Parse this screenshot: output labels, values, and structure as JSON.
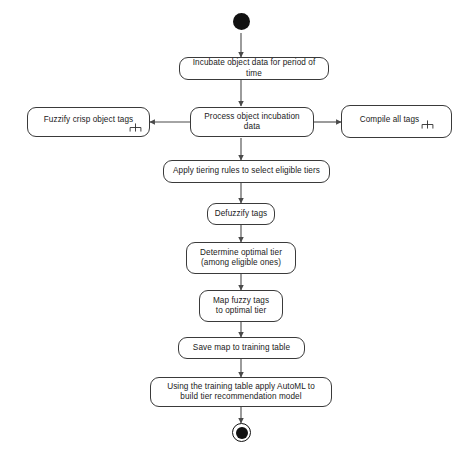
{
  "diagram": {
    "type": "uml-activity-diagram",
    "canvas": {
      "width": 472,
      "height": 457,
      "background": "#ffffff"
    },
    "style": {
      "node_stroke": "#3a3a3a",
      "node_fill": "#ffffff",
      "edge_stroke": "#4a4a4a",
      "terminal_fill": "#111111",
      "text_color": "#1a1a1a"
    },
    "nodes": {
      "start": {
        "name": "initial-node",
        "kind": "initial"
      },
      "incubate": {
        "label": "Incubate object data for period of time",
        "kind": "action"
      },
      "process": {
        "label": "Process object incubation data",
        "kind": "action"
      },
      "fuzzify": {
        "label": "Fuzzify crisp object tags",
        "kind": "call-behavior-action",
        "icon": "rake-icon"
      },
      "compile": {
        "label": "Compile all tags",
        "kind": "call-behavior-action",
        "icon": "rake-icon"
      },
      "apply_tiering": {
        "label": "Apply tiering rules to select eligible tiers",
        "kind": "action"
      },
      "defuzzify": {
        "label": "Defuzzify tags",
        "kind": "action"
      },
      "determine_tier": {
        "label": "Determine optimal tier\n(among eligible ones)",
        "kind": "action"
      },
      "map_tags": {
        "label": "Map fuzzy tags\nto optimal tier",
        "kind": "action"
      },
      "save_map": {
        "label": "Save map to training table",
        "kind": "action"
      },
      "automl": {
        "label": "Using the training table apply AutoML to\nbuild tier recommendation model",
        "kind": "action"
      },
      "end": {
        "name": "final-node",
        "kind": "final"
      }
    },
    "edges": [
      {
        "from": "start",
        "to": "incubate",
        "direction": "down"
      },
      {
        "from": "incubate",
        "to": "process",
        "direction": "down"
      },
      {
        "from": "process",
        "to": "fuzzify",
        "direction": "left"
      },
      {
        "from": "process",
        "to": "compile",
        "direction": "right"
      },
      {
        "from": "process",
        "to": "apply_tiering",
        "direction": "down"
      },
      {
        "from": "apply_tiering",
        "to": "defuzzify",
        "direction": "down"
      },
      {
        "from": "defuzzify",
        "to": "determine_tier",
        "direction": "down"
      },
      {
        "from": "determine_tier",
        "to": "map_tags",
        "direction": "down"
      },
      {
        "from": "map_tags",
        "to": "save_map",
        "direction": "down"
      },
      {
        "from": "save_map",
        "to": "automl",
        "direction": "down"
      },
      {
        "from": "automl",
        "to": "end",
        "direction": "down"
      }
    ]
  }
}
